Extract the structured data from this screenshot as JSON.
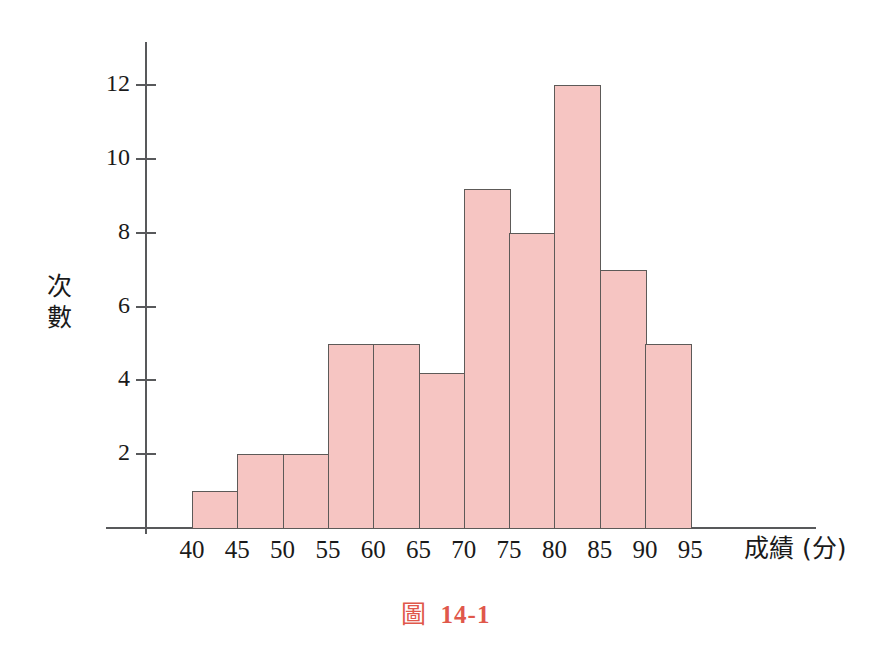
{
  "figure": {
    "caption_prefix": "圖",
    "caption_number": "14-1",
    "caption_color": "#e0584b"
  },
  "axes": {
    "y_label_chars": [
      "次",
      "數"
    ],
    "y_label_text": "次數",
    "x_label_text": "成績 (分)",
    "y_ticks": [
      2,
      4,
      6,
      8,
      10,
      12
    ],
    "x_ticks": [
      40,
      45,
      50,
      55,
      60,
      65,
      70,
      75,
      80,
      85,
      90,
      95
    ],
    "axis_color": "#58595b"
  },
  "style": {
    "bar_fill": "#f6c5c2",
    "bar_stroke": "#5d5a58",
    "background": "#ffffff"
  },
  "chart_data": {
    "type": "bar",
    "xlabel": "成績 (分)",
    "ylabel": "次數",
    "categories": [
      "40-45",
      "45-50",
      "50-55",
      "55-60",
      "60-65",
      "65-70",
      "70-75",
      "75-80",
      "80-85",
      "85-90",
      "90-95"
    ],
    "bin_edges": [
      40,
      45,
      50,
      55,
      60,
      65,
      70,
      75,
      80,
      85,
      90,
      95
    ],
    "values": [
      1,
      2,
      2,
      5,
      5,
      4.2,
      9.2,
      8,
      12,
      7,
      5
    ],
    "xlim": [
      40,
      95
    ],
    "ylim": [
      0,
      12.8
    ],
    "ytick_values": [
      2,
      4,
      6,
      8,
      10,
      12
    ],
    "xtick_values": [
      40,
      45,
      50,
      55,
      60,
      65,
      70,
      75,
      80,
      85,
      90,
      95
    ],
    "grid": false,
    "legend": false
  }
}
